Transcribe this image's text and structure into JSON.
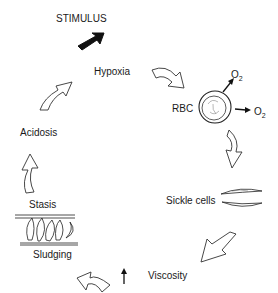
{
  "diagram": {
    "type": "cycle",
    "stimulus_label": "STIMULUS",
    "nodes": [
      {
        "id": "hypoxia",
        "label": "Hypoxia"
      },
      {
        "id": "rbc",
        "label": "RBC"
      },
      {
        "id": "sickle",
        "label": "Sickle cells"
      },
      {
        "id": "viscosity",
        "label": "Viscosity",
        "modifier": "increased"
      },
      {
        "id": "sludging",
        "label": "Sludging"
      },
      {
        "id": "stasis",
        "label": "Stasis"
      },
      {
        "id": "acidosis",
        "label": "Acidosis"
      }
    ],
    "oxygen": {
      "symbol": "O",
      "subscript": "2"
    },
    "edges": [
      [
        "stimulus",
        "hypoxia"
      ],
      [
        "hypoxia",
        "rbc"
      ],
      [
        "rbc",
        "sickle"
      ],
      [
        "sickle",
        "viscosity"
      ],
      [
        "viscosity",
        "sludging"
      ],
      [
        "stasis",
        "acidosis"
      ],
      [
        "acidosis",
        "hypoxia"
      ]
    ],
    "colors": {
      "ink": "#1a1a1a",
      "background": "#ffffff"
    }
  }
}
